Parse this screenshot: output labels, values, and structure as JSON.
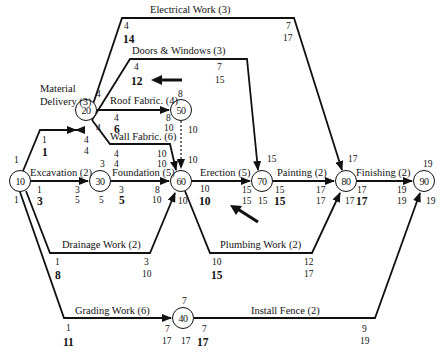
{
  "diagram": {
    "type": "activity-on-arrow project network (CPM)",
    "nodes": [
      {
        "id": "10",
        "x": 20,
        "y": 181,
        "labels": {
          "top": "1",
          "bottom": "1"
        }
      },
      {
        "id": "20",
        "x": 86,
        "y": 110,
        "labels": {
          "top": "4",
          "bottom": "4"
        }
      },
      {
        "id": "30",
        "x": 100,
        "y": 181,
        "labels": {
          "top": "3",
          "bottom": "5"
        }
      },
      {
        "id": "40",
        "x": 183,
        "y": 318,
        "labels": {
          "top": "7",
          "bottom": "17"
        }
      },
      {
        "id": "50",
        "x": 181,
        "y": 110,
        "labels": {
          "top": "8",
          "bottom": "10"
        }
      },
      {
        "id": "60",
        "x": 181,
        "y": 181,
        "labels": {
          "top": "10",
          "bottom": "10"
        }
      },
      {
        "id": "70",
        "x": 262,
        "y": 181,
        "labels": {
          "top": "15",
          "bottom": "15"
        }
      },
      {
        "id": "80",
        "x": 346,
        "y": 181,
        "labels": {
          "top": "17",
          "bottom": "17"
        }
      },
      {
        "id": "90",
        "x": 424,
        "y": 181,
        "labels": {
          "top": "19",
          "bottom": "19"
        }
      }
    ],
    "activities": [
      {
        "name": "Material Delivery (3)",
        "from": "10",
        "to": "20",
        "es": "1",
        "tf": "1",
        "ef": "4",
        "lf": "4"
      },
      {
        "name": "Excavation (2)",
        "from": "10",
        "to": "30",
        "es": "1",
        "tf": "3",
        "ef": "3",
        "lf": "5"
      },
      {
        "name": "Drainage Work (2)",
        "from": "10",
        "to": "60",
        "es": "1",
        "tf": "8",
        "ef": "3",
        "lf": "10"
      },
      {
        "name": "Grading Work (6)",
        "from": "10",
        "to": "40",
        "es": "1",
        "tf": "11",
        "ef": "7",
        "lf": "17"
      },
      {
        "name": "Electrical Work (3)",
        "from": "20",
        "to": "80",
        "es": "4",
        "tf": "14",
        "ef": "7",
        "lf": "17"
      },
      {
        "name": "Doors & Windows (3)",
        "from": "20",
        "to": "70",
        "es": "4",
        "tf": "12",
        "ef": "7",
        "lf": "15"
      },
      {
        "name": "Roof Fabric. (4)",
        "from": "20",
        "to": "50",
        "es": "4",
        "tf": "6",
        "ef": "8",
        "lf": "10"
      },
      {
        "name": "Wall Fabric. (6)",
        "from": "20",
        "to": "60",
        "es": "4",
        "tf": "4",
        "ef": "10",
        "lf": "10"
      },
      {
        "name": "Dummy",
        "from": "50",
        "to": "60",
        "es": "10",
        "tf": "",
        "ef": "",
        "lf": ""
      },
      {
        "name": "Foundation (5)",
        "from": "30",
        "to": "60",
        "es": "3",
        "tf": "5",
        "ef": "8",
        "lf": "10"
      },
      {
        "name": "Erection (5)",
        "from": "60",
        "to": "70",
        "es": "10",
        "tf": "10",
        "ef": "15",
        "lf": "15"
      },
      {
        "name": "Plumbing Work (2)",
        "from": "60",
        "to": "80",
        "es": "10",
        "tf": "15",
        "ef": "12",
        "lf": "17"
      },
      {
        "name": "Painting (2)",
        "from": "70",
        "to": "80",
        "es": "15",
        "tf": "15",
        "ef": "17",
        "lf": "17"
      },
      {
        "name": "Finishing (2)",
        "from": "80",
        "to": "90",
        "es": "17",
        "tf": "17",
        "ef": "19",
        "lf": "19"
      },
      {
        "name": "Install Fence (2)",
        "from": "40",
        "to": "90",
        "es": "7",
        "tf": "17",
        "ef": "9",
        "lf": "19"
      }
    ],
    "text": {
      "electrical": "Electrical Work (3)",
      "doors": "Doors & Windows (3)",
      "material1": "Material",
      "material2": "Delivery (3)",
      "roof": "Roof Fabric. (4)",
      "wall": "Wall Fabric. (6)",
      "excavation": "Excavation (2)",
      "foundation": "Foundation (5)",
      "erection": "Erection (5)",
      "painting": "Painting (2)",
      "finishing": "Finishing (2)",
      "drainage": "Drainage Work (2)",
      "plumbing": "Plumbing Work (2)",
      "grading": "Grading Work (6)",
      "fence": "Install Fence (2)"
    },
    "nums": {
      "n1": "4",
      "n2": "14",
      "n3": "7",
      "n4": "17",
      "n5": "4",
      "n6": "12",
      "n7": "7",
      "n8": "15",
      "n9": "4",
      "n10": "4",
      "n11": "6",
      "n12": "8",
      "n13": "8",
      "n14": "10",
      "n15": "1",
      "n16": "1",
      "n17": "4",
      "n18": "4",
      "n19": "4",
      "n20": "4",
      "n21": "4",
      "n22": "10",
      "n23": "10",
      "n24": "10",
      "n25": "10",
      "n26": "1",
      "n27": "1",
      "n28": "1",
      "n29": "3",
      "n30": "3",
      "n31": "5",
      "n32": "3",
      "n33": "5",
      "n34": "3",
      "n35": "5",
      "n36": "8",
      "n37": "10",
      "n38": "10",
      "n39": "10",
      "n40": "10",
      "n41": "15",
      "n42": "15",
      "n43": "15",
      "n44": "15",
      "n45": "15",
      "n46": "17",
      "n47": "17",
      "n48": "17",
      "n49": "17",
      "n50": "17",
      "n51": "17",
      "n52": "19",
      "n53": "19",
      "n54": "19",
      "n55": "19",
      "n56": "1",
      "n57": "8",
      "n58": "3",
      "n59": "10",
      "n60": "10",
      "n61": "15",
      "n62": "12",
      "n63": "17",
      "n64": "1",
      "n65": "11",
      "n66": "7",
      "n67": "7",
      "n68": "17",
      "n69": "17",
      "n70": "7",
      "n71": "17",
      "n72": "9",
      "n73": "19",
      "n74": "15"
    },
    "colors": {
      "line": "#111111",
      "background": "#ffffff"
    }
  }
}
